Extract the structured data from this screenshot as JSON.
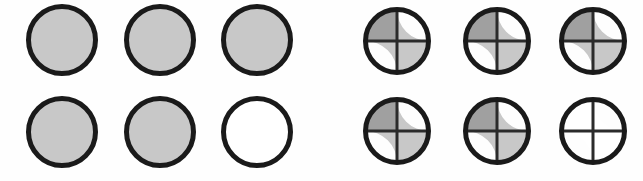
{
  "figure": {
    "title": "",
    "background_color": "#fefefe",
    "width": 643,
    "height": 181
  },
  "palette": {
    "outline": "#1a1a1a",
    "divider": "#2b2b2b",
    "fill_light_gray": "#c8c8c8",
    "fill_dark_gray": "#a0a0a0",
    "fill_empty": "#ffffff"
  },
  "groups": [
    {
      "id": "left-group",
      "name": "plain-circles-group",
      "label": "",
      "style": "plain",
      "origin_x": 0,
      "rows": 2,
      "columns": 3,
      "circle_diameter": 72,
      "stroke_width": 5,
      "col_x": [
        26,
        124,
        221
      ],
      "row_y": [
        4,
        96
      ],
      "circles": [
        {
          "index": 0,
          "row": 0,
          "col": 0,
          "state": "filled",
          "fill": "#c8c8c8"
        },
        {
          "index": 1,
          "row": 0,
          "col": 1,
          "state": "filled",
          "fill": "#c8c8c8"
        },
        {
          "index": 2,
          "row": 0,
          "col": 2,
          "state": "filled",
          "fill": "#c8c8c8"
        },
        {
          "index": 3,
          "row": 1,
          "col": 0,
          "state": "filled",
          "fill": "#c8c8c8"
        },
        {
          "index": 4,
          "row": 1,
          "col": 1,
          "state": "filled",
          "fill": "#c8c8c8"
        },
        {
          "index": 5,
          "row": 1,
          "col": 2,
          "state": "empty",
          "fill": "#ffffff"
        }
      ],
      "filled_count": 5,
      "empty_count": 1,
      "total_count": 6
    },
    {
      "id": "right-group",
      "name": "quartered-circles-group",
      "label": "",
      "style": "quartered",
      "origin_x": 321,
      "rows": 2,
      "columns": 3,
      "circle_diameter": 68,
      "stroke_width": 5,
      "divider_width": 3,
      "col_x": [
        42,
        142,
        238
      ],
      "row_y": [
        7,
        97
      ],
      "circles": [
        {
          "index": 0,
          "row": 0,
          "col": 0,
          "state": "filled",
          "quadrants": {
            "top_left": "#a0a0a0",
            "top_right": "#c8c8c8",
            "bottom_left": "#c8c8c8",
            "bottom_right": "#c8c8c8"
          }
        },
        {
          "index": 1,
          "row": 0,
          "col": 1,
          "state": "filled",
          "quadrants": {
            "top_left": "#a0a0a0",
            "top_right": "#c8c8c8",
            "bottom_left": "#c8c8c8",
            "bottom_right": "#c8c8c8"
          }
        },
        {
          "index": 2,
          "row": 0,
          "col": 2,
          "state": "filled",
          "quadrants": {
            "top_left": "#a0a0a0",
            "top_right": "#c8c8c8",
            "bottom_left": "#c8c8c8",
            "bottom_right": "#c8c8c8"
          }
        },
        {
          "index": 3,
          "row": 1,
          "col": 0,
          "state": "filled",
          "quadrants": {
            "top_left": "#a0a0a0",
            "top_right": "#c8c8c8",
            "bottom_left": "#c8c8c8",
            "bottom_right": "#c8c8c8"
          }
        },
        {
          "index": 4,
          "row": 1,
          "col": 1,
          "state": "filled",
          "quadrants": {
            "top_left": "#a0a0a0",
            "top_right": "#c8c8c8",
            "bottom_left": "#c8c8c8",
            "bottom_right": "#c8c8c8"
          }
        },
        {
          "index": 5,
          "row": 1,
          "col": 2,
          "state": "empty",
          "quadrants": {
            "top_left": "#ffffff",
            "top_right": "#ffffff",
            "bottom_left": "#ffffff",
            "bottom_right": "#ffffff"
          }
        }
      ],
      "filled_count": 5,
      "empty_count": 1,
      "total_count": 6
    }
  ]
}
